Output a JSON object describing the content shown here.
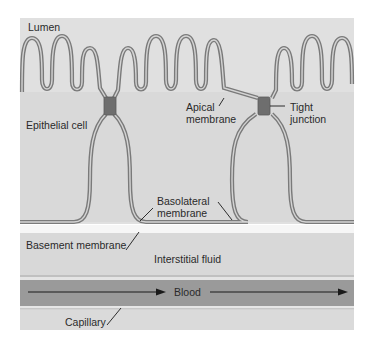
{
  "diagram": {
    "labels": {
      "lumen": "Lumen",
      "epithelial_cell": "Epithelial cell",
      "apical_membrane_line1": "Apical",
      "apical_membrane_line2": "membrane",
      "tight_junction_line1": "Tight",
      "tight_junction_line2": "junction",
      "basolateral_membrane_line1": "Basolateral",
      "basolateral_membrane_line2": "membrane",
      "basement_membrane": "Basement membrane",
      "interstitial_fluid": "Interstitial fluid",
      "blood": "Blood",
      "capillary": "Capillary"
    },
    "colors": {
      "background": "#dcdcdc",
      "membrane": "#8a8a8a",
      "tight_junction": "#6e6e6e",
      "basement_band": "#f6f6f6",
      "interstitial": "#d6d6d6",
      "blood": "#9a9a9a",
      "arrow": "#1a1a1a"
    }
  }
}
